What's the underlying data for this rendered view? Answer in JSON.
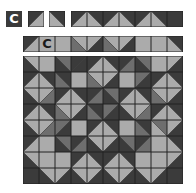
{
  "colors": {
    "D": "#3b3b3b",
    "M": "#6e6e6e",
    "L": "#ababab",
    "line": "#222222"
  },
  "row1": {
    "label": "C",
    "single_tiles": [
      {
        "dir": "/",
        "a": "D",
        "b": "L"
      },
      {
        "dir": "\\",
        "a": "D",
        "b": "L"
      }
    ],
    "strip": [
      {
        "dir": "/",
        "a": "D",
        "b": "L"
      },
      {
        "dir": "\\",
        "a": "D",
        "b": "L"
      },
      {
        "dir": "/",
        "a": "D",
        "b": "L"
      },
      {
        "dir": "\\",
        "a": "D",
        "b": "L"
      },
      {
        "dir": "/",
        "a": "D",
        "b": "L"
      },
      {
        "dir": "\\",
        "a": "D",
        "b": "L"
      },
      {
        "solid": "D"
      }
    ]
  },
  "row2": {
    "label": "C",
    "strip": [
      {
        "dir": "/",
        "a": "D",
        "b": "L"
      },
      {
        "solid": "L",
        "letter": "C"
      },
      {
        "solid": "L"
      },
      {
        "dir": "\\",
        "a": "L",
        "b": "M"
      },
      {
        "dir": "/",
        "a": "L",
        "b": "D"
      },
      {
        "dir": "\\",
        "a": "L",
        "b": "M"
      },
      {
        "dir": "/",
        "a": "L",
        "b": "D"
      },
      {
        "solid": "L"
      },
      {
        "solid": "L"
      },
      {
        "dir": "\\",
        "a": "D",
        "b": "L"
      }
    ]
  },
  "grid": [
    [
      {
        "dir": "\\",
        "a": "L",
        "b": "D"
      },
      {
        "solid": "L"
      },
      {
        "dir": "\\",
        "a": "M",
        "b": "D"
      },
      {
        "dir": "/",
        "a": "D",
        "b": "D"
      },
      {
        "dir": "/",
        "a": "D",
        "b": "L"
      },
      {
        "dir": "\\",
        "a": "D",
        "b": "L"
      },
      {
        "dir": "/",
        "a": "D",
        "b": "M"
      },
      {
        "dir": "\\",
        "a": "M",
        "b": "D"
      },
      {
        "solid": "L"
      },
      {
        "dir": "/",
        "a": "L",
        "b": "D"
      }
    ],
    [
      {
        "dir": "/",
        "a": "D",
        "b": "L"
      },
      {
        "dir": "\\",
        "a": "D",
        "b": "L"
      },
      {
        "dir": "\\",
        "a": "D",
        "b": "M"
      },
      {
        "solid": "L"
      },
      {
        "dir": "\\",
        "a": "L",
        "b": "M"
      },
      {
        "dir": "/",
        "a": "L",
        "b": "D"
      },
      {
        "solid": "L"
      },
      {
        "dir": "/",
        "a": "M",
        "b": "D"
      },
      {
        "dir": "/",
        "a": "D",
        "b": "L"
      },
      {
        "dir": "\\",
        "a": "D",
        "b": "L"
      }
    ],
    [
      {
        "dir": "\\",
        "a": "L",
        "b": "D"
      },
      {
        "dir": "/",
        "a": "L",
        "b": "M"
      },
      {
        "dir": "/",
        "a": "D",
        "b": "L"
      },
      {
        "dir": "\\",
        "a": "D",
        "b": "L"
      },
      {
        "dir": "/",
        "a": "D",
        "b": "M"
      },
      {
        "dir": "\\",
        "a": "M",
        "b": "D"
      },
      {
        "dir": "/",
        "a": "D",
        "b": "L"
      },
      {
        "dir": "\\",
        "a": "D",
        "b": "L"
      },
      {
        "dir": "\\",
        "a": "L",
        "b": "M"
      },
      {
        "dir": "/",
        "a": "L",
        "b": "D"
      }
    ],
    [
      {
        "dir": "/",
        "a": "D",
        "b": "L"
      },
      {
        "dir": "\\",
        "a": "D",
        "b": "L"
      },
      {
        "dir": "\\",
        "a": "L",
        "b": "M"
      },
      {
        "dir": "/",
        "a": "L",
        "b": "D"
      },
      {
        "dir": "\\",
        "a": "D",
        "b": "M"
      },
      {
        "dir": "/",
        "a": "M",
        "b": "D"
      },
      {
        "dir": "\\",
        "a": "L",
        "b": "D"
      },
      {
        "dir": "/",
        "a": "L",
        "b": "M"
      },
      {
        "dir": "/",
        "a": "D",
        "b": "L"
      },
      {
        "dir": "\\",
        "a": "D",
        "b": "L"
      }
    ],
    [
      {
        "dir": "\\",
        "a": "L",
        "b": "D"
      },
      {
        "dir": "/",
        "a": "L",
        "b": "M"
      },
      {
        "dir": "/",
        "a": "M",
        "b": "D"
      },
      {
        "solid": "L"
      },
      {
        "dir": "/",
        "a": "D",
        "b": "L"
      },
      {
        "dir": "\\",
        "a": "D",
        "b": "L"
      },
      {
        "solid": "L"
      },
      {
        "dir": "\\",
        "a": "D",
        "b": "M"
      },
      {
        "dir": "\\",
        "a": "M",
        "b": "L"
      },
      {
        "dir": "/",
        "a": "L",
        "b": "D"
      }
    ],
    [
      {
        "dir": "/",
        "a": "D",
        "b": "L"
      },
      {
        "solid": "L"
      },
      {
        "dir": "\\",
        "a": "M",
        "b": "D"
      },
      {
        "dir": "/",
        "a": "D",
        "b": "M"
      },
      {
        "dir": "\\",
        "a": "L",
        "b": "D"
      },
      {
        "dir": "/",
        "a": "L",
        "b": "D"
      },
      {
        "dir": "\\",
        "a": "M",
        "b": "D"
      },
      {
        "dir": "/",
        "a": "D",
        "b": "M"
      },
      {
        "solid": "L"
      },
      {
        "dir": "\\",
        "a": "D",
        "b": "L"
      }
    ],
    [
      {
        "dir": "\\",
        "a": "L",
        "b": "D"
      },
      {
        "solid": "L"
      },
      {
        "solid": "L"
      },
      {
        "dir": "/",
        "a": "D",
        "b": "L"
      },
      {
        "dir": "\\",
        "a": "D",
        "b": "L"
      },
      {
        "dir": "/",
        "a": "D",
        "b": "L"
      },
      {
        "dir": "\\",
        "a": "D",
        "b": "L"
      },
      {
        "solid": "L"
      },
      {
        "solid": "L"
      },
      {
        "dir": "/",
        "a": "L",
        "b": "D"
      }
    ],
    [
      {
        "solid": "D"
      },
      {
        "dir": "\\",
        "a": "L",
        "b": "D"
      },
      {
        "dir": "/",
        "a": "L",
        "b": "D"
      },
      {
        "dir": "\\",
        "a": "L",
        "b": "D"
      },
      {
        "dir": "/",
        "a": "L",
        "b": "D"
      },
      {
        "dir": "\\",
        "a": "L",
        "b": "D"
      },
      {
        "dir": "/",
        "a": "L",
        "b": "D"
      },
      {
        "dir": "\\",
        "a": "L",
        "b": "D"
      },
      {
        "dir": "/",
        "a": "L",
        "b": "D"
      },
      {
        "solid": "D"
      }
    ]
  ]
}
